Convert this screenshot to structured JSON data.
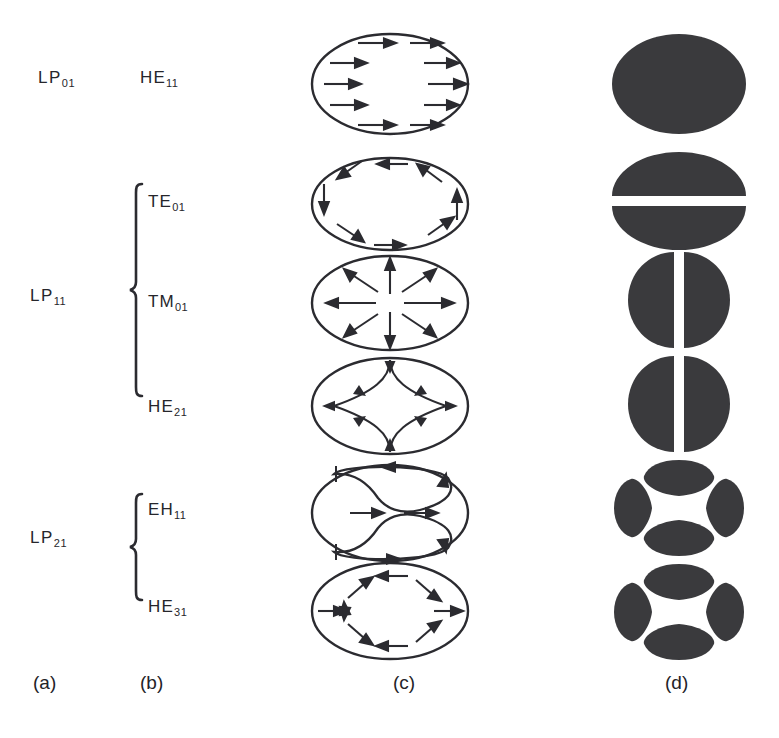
{
  "figure": {
    "ink_color": "#2b2b30",
    "fill_color": "#3a3a3d",
    "background": "#ffffff"
  },
  "columns": [
    {
      "key": "a",
      "caption": "(a)",
      "x": 33,
      "y": 672
    },
    {
      "key": "b",
      "caption": "(b)",
      "x": 140,
      "y": 672
    },
    {
      "key": "c",
      "caption": "(c)",
      "x": 393,
      "y": 672
    },
    {
      "key": "d",
      "caption": "(d)",
      "x": 665,
      "y": 672
    }
  ],
  "lp_groups": [
    {
      "id": "lp01",
      "base": "LP",
      "sub": "01",
      "label_x": 38,
      "label_y": 68,
      "has_brace": false,
      "modes": [
        "he11"
      ]
    },
    {
      "id": "lp11",
      "base": "LP",
      "sub": "11",
      "label_x": 30,
      "label_y": 286,
      "has_brace": true,
      "brace": {
        "x": 128,
        "y": 182,
        "width": 16,
        "height": 216
      },
      "modes": [
        "te01",
        "tm01",
        "he21"
      ]
    },
    {
      "id": "lp21",
      "base": "LP",
      "sub": "21",
      "label_x": 30,
      "label_y": 528,
      "has_brace": true,
      "brace": {
        "x": 128,
        "y": 492,
        "width": 16,
        "height": 110
      },
      "modes": [
        "eh11",
        "he31"
      ]
    }
  ],
  "modes": [
    {
      "id": "he11",
      "base": "HE",
      "sub": "11",
      "label_x": 140,
      "label_y": 68,
      "field_pattern": "uniform-linear-horizontal",
      "field_x": 300,
      "field_y": 28,
      "intensity_pattern": "solid-ellipse",
      "intensity_x": 604,
      "intensity_y": 28
    },
    {
      "id": "te01",
      "base": "TE",
      "sub": "01",
      "label_x": 148,
      "label_y": 192,
      "field_pattern": "azimuthal-circulating",
      "field_x": 300,
      "field_y": 152,
      "intensity_pattern": "horizontal-split-two-lobe",
      "intensity_x": 604,
      "intensity_y": 148
    },
    {
      "id": "tm01",
      "base": "TM",
      "sub": "01",
      "label_x": 148,
      "label_y": 292,
      "field_pattern": "radial-outward",
      "field_x": 300,
      "field_y": 250,
      "intensity_pattern": "vertical-split-two-lobe",
      "intensity_x": 604,
      "intensity_y": 248
    },
    {
      "id": "he21",
      "base": "HE",
      "sub": "21",
      "label_x": 148,
      "label_y": 397,
      "field_pattern": "four-lobe-hyperbolic",
      "field_x": 300,
      "field_y": 352,
      "intensity_pattern": "vertical-split-two-lobe",
      "intensity_x": 604,
      "intensity_y": 352
    },
    {
      "id": "eh11",
      "base": "EH",
      "sub": "11",
      "label_x": 148,
      "label_y": 500,
      "field_pattern": "double-counter-rotating-loops",
      "field_x": 300,
      "field_y": 458,
      "intensity_pattern": "four-lobe-clover",
      "intensity_x": 604,
      "intensity_y": 452
    },
    {
      "id": "he31",
      "base": "HE",
      "sub": "31",
      "label_x": 148,
      "label_y": 597,
      "field_pattern": "hexagonal-zigzag",
      "field_x": 300,
      "field_y": 556,
      "intensity_pattern": "four-lobe-clover",
      "intensity_x": 604,
      "intensity_y": 556
    }
  ]
}
